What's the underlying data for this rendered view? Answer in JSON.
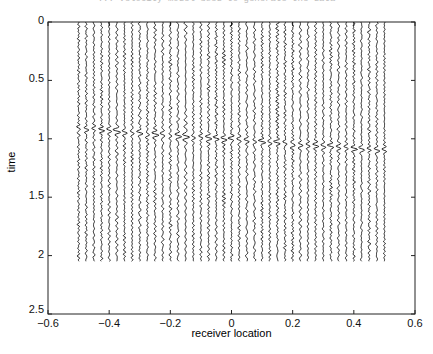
{
  "figure": {
    "title": "... velocity model used to generate the data"
  },
  "chart_data": {
    "type": "line",
    "subtype": "seismic-wiggle-traces",
    "title": "... velocity model used to generate the data",
    "xlabel": "receiver location",
    "ylabel": "time",
    "xlim": [
      -0.6,
      0.6
    ],
    "ylim": [
      0,
      2.5
    ],
    "y_reversed": true,
    "grid": false,
    "legend": null,
    "x_ticks": [
      -0.6,
      -0.4,
      -0.2,
      0,
      0.2,
      0.4,
      0.6
    ],
    "x_tick_labels": [
      "−0.6",
      "−0.4",
      "−0.2",
      "0",
      "0.2",
      "0.4",
      "0.6"
    ],
    "y_ticks": [
      0,
      0.5,
      1,
      1.5,
      2,
      2.5
    ],
    "y_tick_labels": [
      "0",
      "0.5",
      "1",
      "1.5",
      "2",
      "2.5"
    ],
    "traces": {
      "count": 41,
      "x_start": -0.5,
      "x_end": 0.5,
      "x_step": 0.025,
      "t_start": 0,
      "t_end": 2.05,
      "noise_amplitude": 0.004,
      "color": "#111111"
    },
    "reflection_event": {
      "t_at_x_start": 0.91,
      "t_at_x_end": 1.1,
      "amplitude": 0.009,
      "width": 0.04
    }
  }
}
